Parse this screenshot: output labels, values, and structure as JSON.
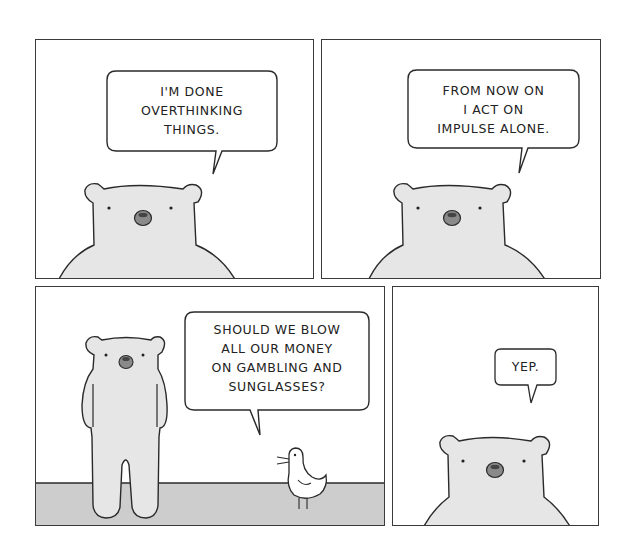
{
  "comic": {
    "panels": [
      {
        "id": 1,
        "speech": "I'M DONE\nOVERTHINKING\nTHINGS.",
        "speaker": "bear"
      },
      {
        "id": 2,
        "speech": "FROM NOW ON\nI ACT ON\nIMPULSE ALONE.",
        "speaker": "bear"
      },
      {
        "id": 3,
        "speech": "SHOULD WE BLOW\nALL OUR MONEY\nON GAMBLING AND\nSUNGLASSES?",
        "speaker": "bird"
      },
      {
        "id": 4,
        "speech": "YEP.",
        "speaker": "bear"
      }
    ],
    "colors": {
      "bear_fill": "#e6e6e6",
      "ground_fill": "#cdcdcd",
      "nose_fill": "#8a8a8a",
      "line": "#2a2a2a",
      "background": "#ffffff"
    }
  }
}
